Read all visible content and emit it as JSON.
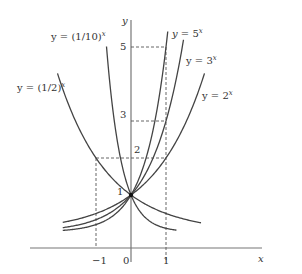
{
  "chart_data": {
    "type": "line",
    "title": "",
    "xlabel": "x",
    "ylabel": "y",
    "xlim": [
      -2.7,
      2.2
    ],
    "ylim": [
      0,
      5.5
    ],
    "grid": false,
    "x_ticks": [
      "-1",
      "0",
      "1"
    ],
    "y_ticks": [
      "1",
      "2",
      "3",
      "5"
    ],
    "annotations": [
      {
        "text": "1",
        "x": 0,
        "y": 1,
        "note": "common point (0,1)"
      },
      {
        "dashed_guides": [
          [
            -1,
            2
          ],
          [
            1,
            2
          ],
          [
            1,
            3
          ],
          [
            1,
            5
          ]
        ]
      }
    ],
    "series": [
      {
        "name": "y = 5^x",
        "base": 5,
        "x_range": [
          -1.95,
          1.05
        ]
      },
      {
        "name": "y = 3^x",
        "base": 3,
        "x_range": [
          -1.95,
          1.5
        ]
      },
      {
        "name": "y = 2^x",
        "base": 2,
        "x_range": [
          -1.95,
          2.1
        ]
      },
      {
        "name": "y = (1/2)^x",
        "base": 0.5,
        "x_range": [
          -2.1,
          2.0
        ]
      },
      {
        "name": "y = (1/10)^x",
        "base": 0.1,
        "x_range": [
          -0.7,
          1.3
        ]
      }
    ]
  },
  "labels": {
    "y_axis": "y",
    "x_axis": "x",
    "tick_neg1": "−1",
    "tick_0": "0",
    "tick_1": "1",
    "ytick_1": "1",
    "ytick_2": "2",
    "ytick_3": "3",
    "ytick_5": "5",
    "series_5": "y = 5",
    "series_3": "y = 3",
    "series_2": "y = 2",
    "series_half": "y = (1/2)",
    "series_tenth": "y = (1/10)",
    "exp": "x"
  }
}
